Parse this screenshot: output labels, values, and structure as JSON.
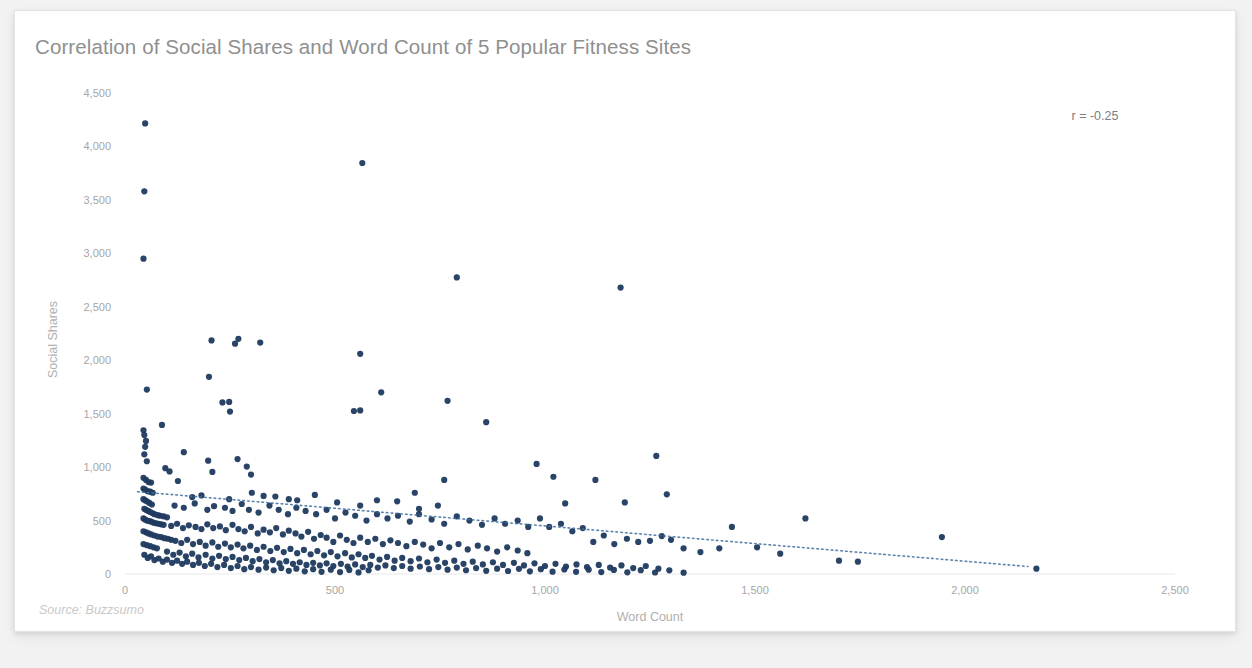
{
  "card": {
    "background": "#ffffff",
    "page_background": "#f2f2f2"
  },
  "chart_data": {
    "type": "scatter",
    "title": "Correlation of Social Shares and Word Count of 5 Popular Fitness Sites",
    "xlabel": "Word Count",
    "ylabel": "Social Shares",
    "xlim": [
      0,
      2500
    ],
    "ylim": [
      0,
      4500
    ],
    "xticks": [
      0,
      500,
      1000,
      1500,
      2000,
      2500
    ],
    "xticklabels": [
      "0",
      "500",
      "1,000",
      "1,500",
      "2,000",
      "2,500"
    ],
    "yticks": [
      0,
      500,
      1000,
      1500,
      2000,
      2500,
      3000,
      3500,
      4000,
      4500
    ],
    "yticklabels": [
      "0",
      "500",
      "1,000",
      "1,500",
      "2,000",
      "2,500",
      "3,000",
      "3,500",
      "4,000",
      "4,500"
    ],
    "grid": false,
    "legend": "none",
    "point_color": "#1f3a5f",
    "point_size": 5,
    "annotation": "r = -0.25",
    "correlation": -0.25,
    "source": "Source: Buzzsumo",
    "trendline": {
      "style": "dotted",
      "color": "#3f6f9f",
      "x_start": 30,
      "y_start": 770,
      "x_end": 2150,
      "y_end": 70
    },
    "points": [
      [
        48,
        4215
      ],
      [
        46,
        3580
      ],
      [
        44,
        2950
      ],
      [
        565,
        3845
      ],
      [
        790,
        2775
      ],
      [
        1180,
        2680
      ],
      [
        206,
        2185
      ],
      [
        270,
        2200
      ],
      [
        262,
        2155
      ],
      [
        322,
        2165
      ],
      [
        560,
        2060
      ],
      [
        52,
        1725
      ],
      [
        200,
        1845
      ],
      [
        232,
        1605
      ],
      [
        248,
        1610
      ],
      [
        250,
        1520
      ],
      [
        545,
        1525
      ],
      [
        560,
        1530
      ],
      [
        610,
        1700
      ],
      [
        768,
        1620
      ],
      [
        860,
        1420
      ],
      [
        88,
        1395
      ],
      [
        44,
        1345
      ],
      [
        46,
        1300
      ],
      [
        50,
        1245
      ],
      [
        48,
        1190
      ],
      [
        140,
        1140
      ],
      [
        198,
        1060
      ],
      [
        268,
        1075
      ],
      [
        46,
        1120
      ],
      [
        52,
        1055
      ],
      [
        96,
        990
      ],
      [
        106,
        960
      ],
      [
        208,
        955
      ],
      [
        290,
        1005
      ],
      [
        300,
        930
      ],
      [
        980,
        1030
      ],
      [
        1020,
        910
      ],
      [
        1265,
        1105
      ],
      [
        1120,
        880
      ],
      [
        44,
        900
      ],
      [
        50,
        880
      ],
      [
        56,
        860
      ],
      [
        62,
        855
      ],
      [
        126,
        870
      ],
      [
        760,
        880
      ],
      [
        690,
        760
      ],
      [
        1290,
        745
      ],
      [
        1190,
        670
      ],
      [
        1048,
        660
      ],
      [
        44,
        800
      ],
      [
        48,
        790
      ],
      [
        54,
        775
      ],
      [
        60,
        770
      ],
      [
        66,
        760
      ],
      [
        160,
        720
      ],
      [
        182,
        735
      ],
      [
        248,
        700
      ],
      [
        302,
        760
      ],
      [
        330,
        730
      ],
      [
        358,
        725
      ],
      [
        390,
        700
      ],
      [
        410,
        690
      ],
      [
        452,
        740
      ],
      [
        505,
        670
      ],
      [
        560,
        640
      ],
      [
        600,
        690
      ],
      [
        648,
        680
      ],
      [
        700,
        610
      ],
      [
        745,
        640
      ],
      [
        44,
        700
      ],
      [
        48,
        690
      ],
      [
        52,
        680
      ],
      [
        58,
        665
      ],
      [
        64,
        650
      ],
      [
        118,
        640
      ],
      [
        140,
        620
      ],
      [
        166,
        660
      ],
      [
        196,
        600
      ],
      [
        212,
        635
      ],
      [
        238,
        620
      ],
      [
        256,
        590
      ],
      [
        278,
        655
      ],
      [
        295,
        600
      ],
      [
        318,
        575
      ],
      [
        344,
        640
      ],
      [
        366,
        600
      ],
      [
        388,
        560
      ],
      [
        408,
        620
      ],
      [
        430,
        590
      ],
      [
        46,
        610
      ],
      [
        50,
        600
      ],
      [
        55,
        590
      ],
      [
        60,
        580
      ],
      [
        65,
        570
      ],
      [
        70,
        560
      ],
      [
        78,
        550
      ],
      [
        84,
        545
      ],
      [
        92,
        540
      ],
      [
        100,
        530
      ],
      [
        455,
        560
      ],
      [
        480,
        600
      ],
      [
        500,
        520
      ],
      [
        525,
        575
      ],
      [
        548,
        545
      ],
      [
        575,
        500
      ],
      [
        600,
        560
      ],
      [
        625,
        520
      ],
      [
        650,
        545
      ],
      [
        678,
        490
      ],
      [
        44,
        520
      ],
      [
        48,
        510
      ],
      [
        52,
        500
      ],
      [
        58,
        495
      ],
      [
        62,
        490
      ],
      [
        68,
        480
      ],
      [
        74,
        475
      ],
      [
        80,
        470
      ],
      [
        86,
        465
      ],
      [
        92,
        460
      ],
      [
        700,
        560
      ],
      [
        730,
        510
      ],
      [
        760,
        470
      ],
      [
        790,
        540
      ],
      [
        820,
        500
      ],
      [
        850,
        460
      ],
      [
        880,
        520
      ],
      [
        905,
        470
      ],
      [
        935,
        500
      ],
      [
        960,
        440
      ],
      [
        1445,
        440
      ],
      [
        1620,
        520
      ],
      [
        1945,
        345
      ],
      [
        2170,
        50
      ],
      [
        110,
        450
      ],
      [
        124,
        470
      ],
      [
        138,
        430
      ],
      [
        152,
        455
      ],
      [
        168,
        440
      ],
      [
        182,
        420
      ],
      [
        196,
        465
      ],
      [
        210,
        430
      ],
      [
        226,
        445
      ],
      [
        240,
        410
      ],
      [
        988,
        520
      ],
      [
        1010,
        440
      ],
      [
        1038,
        470
      ],
      [
        1065,
        400
      ],
      [
        1090,
        430
      ],
      [
        1115,
        300
      ],
      [
        1140,
        360
      ],
      [
        1165,
        280
      ],
      [
        1195,
        330
      ],
      [
        1222,
        300
      ],
      [
        256,
        460
      ],
      [
        270,
        420
      ],
      [
        285,
        400
      ],
      [
        300,
        440
      ],
      [
        316,
        380
      ],
      [
        330,
        415
      ],
      [
        345,
        390
      ],
      [
        360,
        430
      ],
      [
        376,
        370
      ],
      [
        390,
        405
      ],
      [
        1250,
        310
      ],
      [
        1278,
        355
      ],
      [
        1300,
        320
      ],
      [
        1330,
        240
      ],
      [
        1370,
        205
      ],
      [
        1415,
        240
      ],
      [
        1505,
        250
      ],
      [
        1560,
        190
      ],
      [
        1700,
        125
      ],
      [
        1745,
        115
      ],
      [
        406,
        380
      ],
      [
        420,
        350
      ],
      [
        436,
        395
      ],
      [
        450,
        330
      ],
      [
        466,
        365
      ],
      [
        480,
        340
      ],
      [
        496,
        300
      ],
      [
        512,
        360
      ],
      [
        528,
        320
      ],
      [
        544,
        290
      ],
      [
        44,
        400
      ],
      [
        50,
        390
      ],
      [
        56,
        380
      ],
      [
        62,
        370
      ],
      [
        70,
        360
      ],
      [
        78,
        350
      ],
      [
        86,
        345
      ],
      [
        94,
        335
      ],
      [
        102,
        330
      ],
      [
        110,
        320
      ],
      [
        560,
        340
      ],
      [
        578,
        300
      ],
      [
        596,
        330
      ],
      [
        614,
        280
      ],
      [
        632,
        315
      ],
      [
        650,
        290
      ],
      [
        670,
        260
      ],
      [
        690,
        300
      ],
      [
        710,
        275
      ],
      [
        730,
        240
      ],
      [
        120,
        310
      ],
      [
        134,
        290
      ],
      [
        148,
        320
      ],
      [
        162,
        280
      ],
      [
        178,
        300
      ],
      [
        192,
        265
      ],
      [
        208,
        295
      ],
      [
        222,
        255
      ],
      [
        238,
        285
      ],
      [
        252,
        250
      ],
      [
        750,
        290
      ],
      [
        772,
        250
      ],
      [
        794,
        280
      ],
      [
        816,
        230
      ],
      [
        840,
        265
      ],
      [
        862,
        240
      ],
      [
        886,
        210
      ],
      [
        910,
        250
      ],
      [
        935,
        220
      ],
      [
        958,
        195
      ],
      [
        268,
        275
      ],
      [
        282,
        240
      ],
      [
        298,
        265
      ],
      [
        314,
        225
      ],
      [
        330,
        255
      ],
      [
        346,
        215
      ],
      [
        362,
        245
      ],
      [
        378,
        205
      ],
      [
        394,
        235
      ],
      [
        410,
        195
      ],
      [
        44,
        280
      ],
      [
        52,
        270
      ],
      [
        60,
        260
      ],
      [
        68,
        250
      ],
      [
        76,
        240
      ],
      [
        426,
        225
      ],
      [
        442,
        185
      ],
      [
        458,
        215
      ],
      [
        474,
        175
      ],
      [
        490,
        205
      ],
      [
        506,
        165
      ],
      [
        524,
        195
      ],
      [
        540,
        155
      ],
      [
        556,
        185
      ],
      [
        572,
        150
      ],
      [
        100,
        210
      ],
      [
        115,
        180
      ],
      [
        130,
        200
      ],
      [
        145,
        165
      ],
      [
        160,
        190
      ],
      [
        175,
        155
      ],
      [
        192,
        180
      ],
      [
        208,
        145
      ],
      [
        224,
        170
      ],
      [
        240,
        140
      ],
      [
        588,
        170
      ],
      [
        606,
        135
      ],
      [
        624,
        160
      ],
      [
        642,
        125
      ],
      [
        660,
        150
      ],
      [
        680,
        120
      ],
      [
        700,
        145
      ],
      [
        720,
        110
      ],
      [
        742,
        135
      ],
      [
        762,
        105
      ],
      [
        256,
        160
      ],
      [
        272,
        130
      ],
      [
        288,
        150
      ],
      [
        304,
        120
      ],
      [
        320,
        140
      ],
      [
        336,
        110
      ],
      [
        352,
        130
      ],
      [
        368,
        100
      ],
      [
        384,
        120
      ],
      [
        400,
        95
      ],
      [
        784,
        125
      ],
      [
        806,
        95
      ],
      [
        828,
        115
      ],
      [
        852,
        90
      ],
      [
        876,
        110
      ],
      [
        900,
        85
      ],
      [
        926,
        105
      ],
      [
        950,
        80
      ],
      [
        975,
        100
      ],
      [
        1000,
        75
      ],
      [
        416,
        110
      ],
      [
        432,
        85
      ],
      [
        448,
        105
      ],
      [
        464,
        80
      ],
      [
        480,
        100
      ],
      [
        496,
        75
      ],
      [
        514,
        95
      ],
      [
        530,
        70
      ],
      [
        548,
        90
      ],
      [
        566,
        65
      ],
      [
        1025,
        95
      ],
      [
        1050,
        70
      ],
      [
        1075,
        90
      ],
      [
        1100,
        65
      ],
      [
        1128,
        85
      ],
      [
        1155,
        60
      ],
      [
        1182,
        80
      ],
      [
        1210,
        55
      ],
      [
        1240,
        75
      ],
      [
        1270,
        50
      ],
      [
        584,
        85
      ],
      [
        602,
        60
      ],
      [
        620,
        80
      ],
      [
        640,
        55
      ],
      [
        660,
        75
      ],
      [
        680,
        50
      ],
      [
        702,
        70
      ],
      [
        724,
        45
      ],
      [
        746,
        65
      ],
      [
        768,
        40
      ],
      [
        46,
        180
      ],
      [
        54,
        150
      ],
      [
        62,
        165
      ],
      [
        70,
        130
      ],
      [
        80,
        145
      ],
      [
        90,
        115
      ],
      [
        100,
        135
      ],
      [
        112,
        105
      ],
      [
        124,
        125
      ],
      [
        136,
        95
      ],
      [
        148,
        115
      ],
      [
        162,
        85
      ],
      [
        176,
        105
      ],
      [
        190,
        75
      ],
      [
        205,
        95
      ],
      [
        220,
        65
      ],
      [
        236,
        85
      ],
      [
        252,
        55
      ],
      [
        268,
        75
      ],
      [
        284,
        45
      ],
      [
        300,
        65
      ],
      [
        318,
        40
      ],
      [
        336,
        60
      ],
      [
        354,
        35
      ],
      [
        372,
        55
      ],
      [
        790,
        60
      ],
      [
        812,
        35
      ],
      [
        836,
        55
      ],
      [
        860,
        30
      ],
      [
        886,
        50
      ],
      [
        912,
        28
      ],
      [
        938,
        48
      ],
      [
        964,
        25
      ],
      [
        990,
        45
      ],
      [
        1018,
        22
      ],
      [
        1046,
        42
      ],
      [
        1074,
        20
      ],
      [
        1104,
        40
      ],
      [
        1134,
        18
      ],
      [
        1164,
        38
      ],
      [
        1196,
        16
      ],
      [
        1228,
        36
      ],
      [
        1262,
        14
      ],
      [
        1296,
        34
      ],
      [
        1330,
        12
      ],
      [
        390,
        30
      ],
      [
        408,
        50
      ],
      [
        428,
        25
      ],
      [
        448,
        45
      ],
      [
        468,
        20
      ],
      [
        490,
        40
      ],
      [
        512,
        18
      ],
      [
        534,
        38
      ],
      [
        556,
        15
      ],
      [
        580,
        35
      ]
    ]
  }
}
